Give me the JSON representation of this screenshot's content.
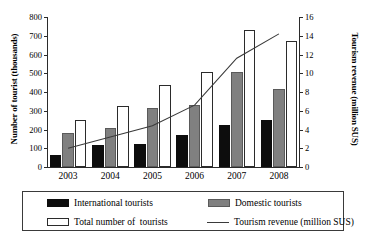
{
  "chart_data": {
    "type": "bar",
    "title": "",
    "subtitle": "",
    "xlabel": "",
    "ylabel": "Number of tourist (thousands)",
    "y2label": "Tourism revenue (million SUS)",
    "categories": [
      "2003",
      "2004",
      "2005",
      "2006",
      "2007",
      "2008"
    ],
    "ylim": [
      0,
      800
    ],
    "y2lim": [
      0,
      16
    ],
    "yticks": [
      "0",
      "100",
      "200",
      "300",
      "400",
      "500",
      "600",
      "700",
      "800"
    ],
    "ytick_values": [
      0,
      100,
      200,
      300,
      400,
      500,
      600,
      700,
      800
    ],
    "y2ticks": [
      "0",
      "2",
      "4",
      "6",
      "8",
      "10",
      "12",
      "14",
      "16"
    ],
    "y2tick_values": [
      0,
      2,
      4,
      6,
      8,
      10,
      12,
      14,
      16
    ],
    "grid": false,
    "legend_position": "below",
    "series": [
      {
        "name": "International tourists",
        "kind": "bar",
        "axis": "left",
        "color": "#0d0d0d",
        "values": [
          63,
          115,
          123,
          169,
          225,
          250
        ]
      },
      {
        "name": "Domestic tourists",
        "kind": "bar",
        "axis": "left",
        "color": "#808080",
        "values": [
          181,
          209,
          314,
          330,
          508,
          418
        ]
      },
      {
        "name": "Total number of  tourists",
        "kind": "bar",
        "axis": "left",
        "color": "#ffffff",
        "values": [
          250,
          326,
          437,
          507,
          733,
          673
        ]
      },
      {
        "name": "Tourism revenue (million SUS)",
        "kind": "line",
        "axis": "right",
        "color": "#3a3a3a",
        "values": [
          2.0,
          3.2,
          4.4,
          6.6,
          11.6,
          14.2
        ]
      }
    ]
  },
  "legend": {
    "items": [
      {
        "label": "International tourists",
        "marker": "filled-black-square"
      },
      {
        "label": "Domestic tourists",
        "marker": "filled-gray-square"
      },
      {
        "label": "Total number of  tourists",
        "marker": "open-white-square"
      },
      {
        "label": "Tourism revenue (million SUS)",
        "marker": "line"
      }
    ]
  },
  "caption_fragment": ""
}
